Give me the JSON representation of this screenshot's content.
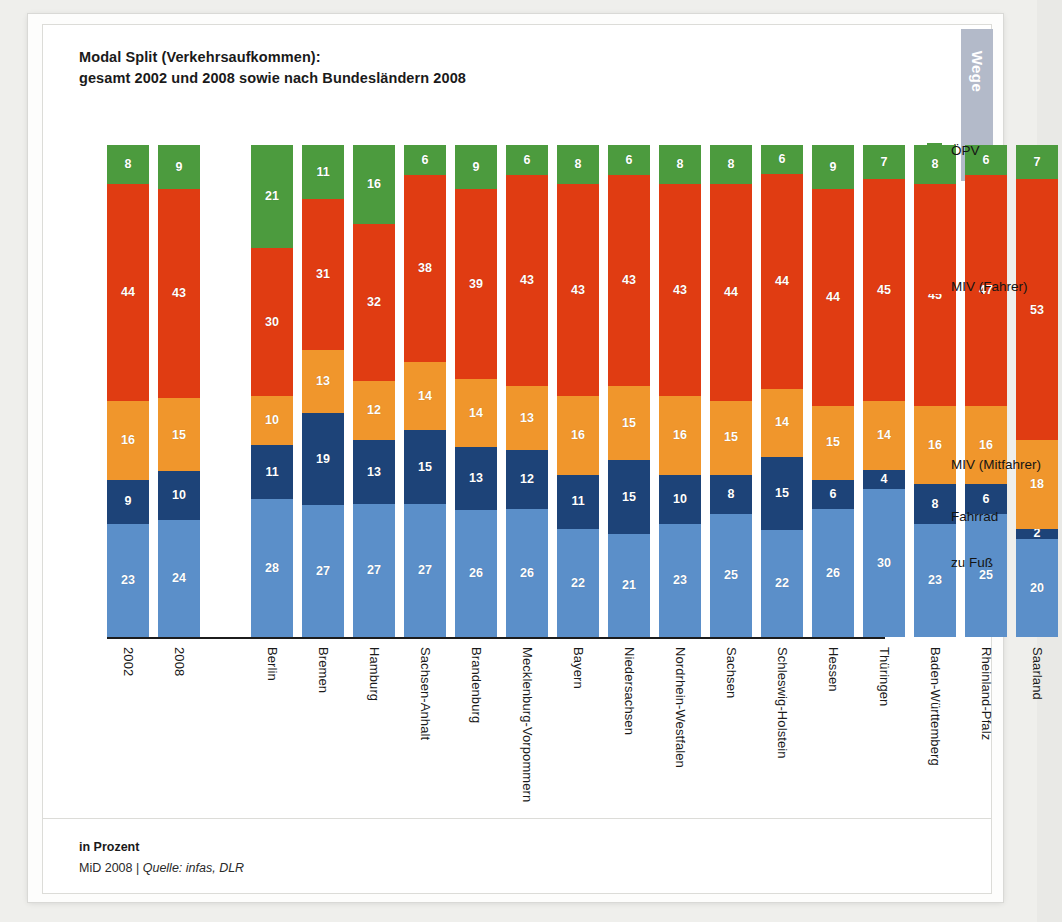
{
  "header": {
    "title_line1": "Modal Split (Verkehrsaufkommen):",
    "title_line2": "gesamt 2002 und 2008 sowie nach Bundesländern 2008",
    "side_tab": "Wege"
  },
  "footer": {
    "unit": "in Prozent",
    "source_prefix": "MiD 2008 | ",
    "source_italic": "Quelle: infas, DLR"
  },
  "legend": [
    {
      "label": "ÖPV",
      "color": "#4c9b3e"
    },
    {
      "label": "MIV (Fahrer)",
      "color": "#e03c12"
    },
    {
      "label": "MIV (Mitfahrer)",
      "color": "#f0962c"
    },
    {
      "label": "Fahrrad",
      "color": "#1d4378"
    },
    {
      "label": "zu Fuß",
      "color": "#5b8fc9"
    }
  ],
  "chart_data": {
    "type": "bar",
    "subtype": "stacked-column",
    "title": "Modal Split (Verkehrsaufkommen): gesamt 2002 und 2008 sowie nach Bundesländern 2008",
    "xlabel": "",
    "ylabel": "in Prozent",
    "ylim": [
      0,
      100
    ],
    "grid": false,
    "legend_position": "right",
    "stack_order_bottom_to_top": [
      "zu Fuß",
      "Fahrrad",
      "MIV (Mitfahrer)",
      "MIV (Fahrer)",
      "ÖPV"
    ],
    "categories": [
      "2002",
      "2008",
      "Berlin",
      "Bremen",
      "Hamburg",
      "Sachsen-Anhalt",
      "Brandenburg",
      "Mecklenburg-Vorpommern",
      "Bayern",
      "Niedersachsen",
      "Nordrhein-Westfalen",
      "Sachsen",
      "Schleswig-Holstein",
      "Hessen",
      "Thüringen",
      "Baden-Württemberg",
      "Rheinland-Pfalz",
      "Saarland"
    ],
    "group_break_after_index": 1,
    "series": [
      {
        "name": "ÖPV",
        "color": "#4c9b3e",
        "values": [
          8,
          9,
          21,
          11,
          16,
          6,
          9,
          6,
          8,
          6,
          8,
          8,
          6,
          9,
          7,
          8,
          6,
          7
        ]
      },
      {
        "name": "MIV (Fahrer)",
        "color": "#e03c12",
        "values": [
          44,
          43,
          30,
          31,
          32,
          38,
          39,
          43,
          43,
          43,
          43,
          44,
          44,
          44,
          45,
          45,
          47,
          53
        ]
      },
      {
        "name": "MIV (Mitfahrer)",
        "color": "#f0962c",
        "values": [
          16,
          15,
          10,
          13,
          12,
          14,
          14,
          13,
          16,
          15,
          16,
          15,
          14,
          15,
          14,
          16,
          16,
          18
        ]
      },
      {
        "name": "Fahrrad",
        "color": "#1d4378",
        "values": [
          9,
          10,
          11,
          19,
          13,
          15,
          13,
          12,
          11,
          15,
          10,
          8,
          15,
          6,
          4,
          8,
          6,
          2
        ]
      },
      {
        "name": "zu Fuß",
        "color": "#5b8fc9",
        "values": [
          23,
          24,
          28,
          27,
          27,
          27,
          26,
          26,
          22,
          21,
          23,
          25,
          22,
          26,
          30,
          23,
          25,
          20
        ]
      }
    ]
  }
}
